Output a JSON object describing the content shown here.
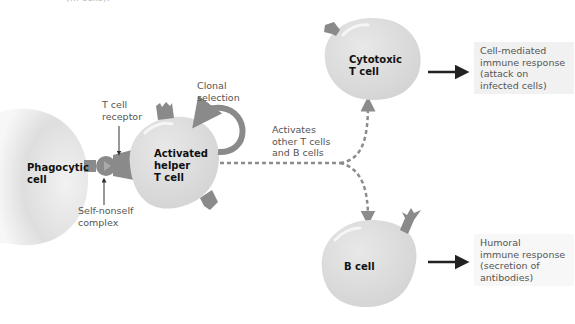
{
  "top_fragment": "(... cells).",
  "cells": {
    "phagocytic": {
      "line1": "Phagocytic",
      "line2": "cell"
    },
    "helper": {
      "line1": "Activated",
      "line2": "helper",
      "line3": "T cell"
    },
    "cytotoxic": {
      "line1": "Cytotoxic",
      "line2": "T cell"
    },
    "bcell": {
      "line1": "B cell"
    }
  },
  "labels": {
    "tcr": {
      "line1": "T cell",
      "line2": "receptor"
    },
    "complex": {
      "line1": "Self-nonself",
      "line2": "complex"
    },
    "clonal": {
      "line1": "Clonal",
      "line2": "selection"
    },
    "activates": {
      "line1": "Activates",
      "line2": "other T cells",
      "line3": "and B cells"
    }
  },
  "responses": {
    "cell_mediated": {
      "line1": "Cell-mediated",
      "line2": "immune response",
      "line3": "(attack on",
      "line4": "infected cells)"
    },
    "humoral": {
      "line1": "Humoral",
      "line2": "immune response",
      "line3": "(secretion of",
      "line4": "antibodies)"
    }
  },
  "colors": {
    "cell_fill": "#dcdcdc",
    "receptor": "#8a8a8a",
    "dashed": "#8c8c8c",
    "arrow": "#222222",
    "response_box": "#f1f1f1"
  }
}
